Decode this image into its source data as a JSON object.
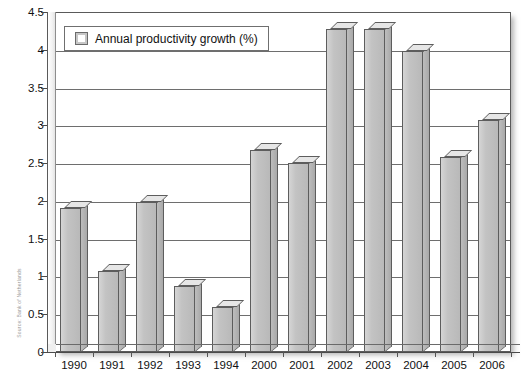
{
  "chart_data": {
    "type": "bar",
    "title": "",
    "subtitle": "",
    "xlabel": "",
    "ylabel": "",
    "categories": [
      "1990",
      "1991",
      "1992",
      "1993",
      "1994",
      "2000",
      "2001",
      "2002",
      "2003",
      "2004",
      "2005",
      "2006"
    ],
    "values": [
      1.9,
      1.07,
      1.98,
      0.88,
      0.6,
      2.67,
      2.5,
      4.27,
      4.27,
      3.98,
      2.58,
      3.07
    ],
    "series": [
      {
        "name": "Annual productivity growth (%)",
        "values": [
          1.9,
          1.07,
          1.98,
          0.88,
          0.6,
          2.67,
          2.5,
          4.27,
          4.27,
          3.98,
          2.58,
          3.07
        ]
      }
    ],
    "ylim": [
      0,
      4.5
    ],
    "ytick_values": [
      0,
      0.5,
      1,
      1.5,
      2,
      2.5,
      3,
      3.5,
      4,
      4.5
    ],
    "ytick_labels": [
      "0",
      "0.5",
      "1",
      "1.5",
      "2",
      "2.5",
      "3",
      "3.5",
      "4",
      "4.5"
    ],
    "grid": "horizontal",
    "legend_position": "top-left",
    "style": "3d-column",
    "colors": {
      "bar_face": "#c3c3c3",
      "bar_side": "#a9a9a9",
      "bar_top": "#e6e6e6",
      "bar_outline": "#5d5d5d",
      "gridline": "#6e6e6e",
      "frame": "#5a5a5a",
      "background": "#ffffff",
      "text": "#111111"
    }
  },
  "legend": {
    "entries": [
      {
        "label": "Annual productivity growth (%)",
        "swatch_icon": "square-swatch-icon"
      }
    ]
  },
  "source": {
    "caption": "Source: Bank of Netherlands"
  }
}
